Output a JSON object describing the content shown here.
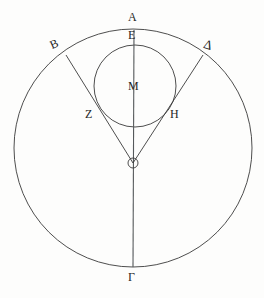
{
  "figure": {
    "background_color": "#fdfdfc",
    "stroke_color": "#3a3a3a",
    "label_color": "#262626"
  },
  "shapes": {
    "outer_circle": {
      "name": "outer-circle",
      "center_x": 133,
      "center_y": 148,
      "radius": 119
    },
    "inner_circle": {
      "name": "inner-circle",
      "center_x": 135,
      "center_y": 86,
      "radius": 41
    },
    "vertical_axis": {
      "name": "vertical-diameter",
      "x1": 134,
      "y1": 30,
      "x2": 133,
      "y2": 267
    },
    "tangent_left": {
      "name": "tangent-line-theta-z-b",
      "x1": 133,
      "y1": 163,
      "x2": 66,
      "y2": 55
    },
    "tangent_right": {
      "name": "tangent-line-theta-h-delta",
      "x1": 133,
      "y1": 163,
      "x2": 203,
      "y2": 55
    },
    "theta_marker": {
      "name": "theta-vertex-marker",
      "cx": 133,
      "cy": 163,
      "r": 5
    }
  },
  "labels": {
    "A": "Α",
    "E": "Ε",
    "B": "Β",
    "D": "Δ",
    "Z": "Ζ",
    "H": "Η",
    "M": "Μ",
    "G": "Γ",
    "T": "Θ"
  },
  "points": [
    {
      "label": "Α",
      "role": "top-of-outer-circle",
      "x": 134,
      "y": 30
    },
    {
      "label": "Ε",
      "role": "top-of-inner-circle",
      "x": 134,
      "y": 45
    },
    {
      "label": "Β",
      "role": "outer-circle-upper-left",
      "x": 66,
      "y": 55
    },
    {
      "label": "Δ",
      "role": "outer-circle-upper-right",
      "x": 203,
      "y": 55
    },
    {
      "label": "Ζ",
      "role": "left-tangent-point",
      "x": 103,
      "y": 116
    },
    {
      "label": "Η",
      "role": "right-tangent-point",
      "x": 166,
      "y": 116
    },
    {
      "label": "Μ",
      "role": "center-of-inner-circle",
      "x": 135,
      "y": 86
    },
    {
      "label": "Θ",
      "role": "center-of-outer-circle-vertex",
      "x": 133,
      "y": 163
    },
    {
      "label": "Γ",
      "role": "bottom-of-outer-circle",
      "x": 133,
      "y": 267
    }
  ]
}
